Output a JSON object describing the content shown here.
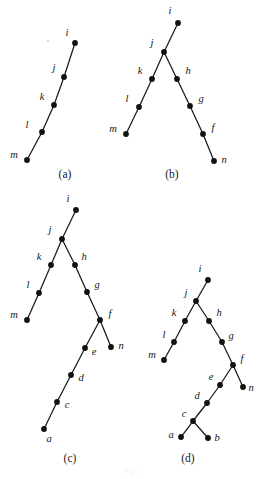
{
  "figure": {
    "background_color": "#ffffff",
    "ink_color": "#111111",
    "bottom_caption": "Fig. 1. ",
    "panels": [
      {
        "id": "a",
        "caption": "(a)",
        "caption_pos": {
          "x": 65,
          "y": 178
        },
        "nodes": [
          {
            "name": "i",
            "x": 75,
            "y": 43,
            "label": "i",
            "label_x": 67,
            "label_y": 36,
            "anchor": "middle"
          },
          {
            "name": "j",
            "x": 64,
            "y": 77,
            "label": "j",
            "label_x": 54,
            "label_y": 71,
            "anchor": "middle"
          },
          {
            "name": "k",
            "x": 54,
            "y": 105,
            "label": "k",
            "label_x": 42,
            "label_y": 100,
            "anchor": "middle"
          },
          {
            "name": "l",
            "x": 42,
            "y": 132,
            "label": "l",
            "label_x": 27,
            "label_y": 128,
            "anchor": "middle"
          },
          {
            "name": "m",
            "x": 27,
            "y": 160,
            "label": "m",
            "label_x": 14,
            "label_y": 158,
            "anchor": "middle"
          }
        ],
        "edges": [
          [
            "i",
            "j"
          ],
          [
            "j",
            "k"
          ],
          [
            "k",
            "l"
          ],
          [
            "l",
            "m"
          ]
        ]
      },
      {
        "id": "b",
        "caption": "(b)",
        "caption_pos": {
          "x": 172,
          "y": 178
        },
        "nodes": [
          {
            "name": "i",
            "x": 178,
            "y": 23,
            "label": "i",
            "label_x": 170,
            "label_y": 14,
            "anchor": "middle"
          },
          {
            "name": "j",
            "x": 164,
            "y": 52,
            "label": "j",
            "label_x": 152,
            "label_y": 46,
            "anchor": "middle"
          },
          {
            "name": "k",
            "x": 152,
            "y": 79,
            "label": "k",
            "label_x": 140,
            "label_y": 74,
            "anchor": "middle"
          },
          {
            "name": "l",
            "x": 139,
            "y": 107,
            "label": "l",
            "label_x": 127,
            "label_y": 102,
            "anchor": "middle"
          },
          {
            "name": "m",
            "x": 126,
            "y": 134,
            "label": "m",
            "label_x": 113,
            "label_y": 132,
            "anchor": "middle"
          },
          {
            "name": "h",
            "x": 177,
            "y": 79,
            "label": "h",
            "label_x": 188,
            "label_y": 74,
            "anchor": "middle"
          },
          {
            "name": "g",
            "x": 190,
            "y": 106,
            "label": "g",
            "label_x": 201,
            "label_y": 102,
            "anchor": "middle"
          },
          {
            "name": "f",
            "x": 203,
            "y": 134,
            "label": "f",
            "label_x": 213,
            "label_y": 131,
            "anchor": "middle"
          },
          {
            "name": "n",
            "x": 214,
            "y": 161,
            "label": "n",
            "label_x": 224,
            "label_y": 163,
            "anchor": "middle"
          }
        ],
        "edges": [
          [
            "i",
            "j"
          ],
          [
            "j",
            "k"
          ],
          [
            "k",
            "l"
          ],
          [
            "l",
            "m"
          ],
          [
            "j",
            "h"
          ],
          [
            "h",
            "g"
          ],
          [
            "g",
            "f"
          ],
          [
            "f",
            "n"
          ]
        ]
      },
      {
        "id": "c",
        "caption": "(c)",
        "caption_pos": {
          "x": 70,
          "y": 462
        },
        "nodes": [
          {
            "name": "i",
            "x": 76,
            "y": 210,
            "label": "i",
            "label_x": 68,
            "label_y": 202,
            "anchor": "middle"
          },
          {
            "name": "j",
            "x": 62,
            "y": 239,
            "label": "j",
            "label_x": 50,
            "label_y": 233,
            "anchor": "middle"
          },
          {
            "name": "k",
            "x": 51,
            "y": 265,
            "label": "k",
            "label_x": 39,
            "label_y": 260,
            "anchor": "middle"
          },
          {
            "name": "l",
            "x": 39,
            "y": 293,
            "label": "l",
            "label_x": 28,
            "label_y": 288,
            "anchor": "middle"
          },
          {
            "name": "m",
            "x": 27,
            "y": 320,
            "label": "m",
            "label_x": 14,
            "label_y": 318,
            "anchor": "middle"
          },
          {
            "name": "h",
            "x": 75,
            "y": 265,
            "label": "h",
            "label_x": 84,
            "label_y": 260,
            "anchor": "middle"
          },
          {
            "name": "g",
            "x": 87,
            "y": 292,
            "label": "g",
            "label_x": 97,
            "label_y": 288,
            "anchor": "middle"
          },
          {
            "name": "f",
            "x": 100,
            "y": 320,
            "label": "f",
            "label_x": 110,
            "label_y": 317,
            "anchor": "middle"
          },
          {
            "name": "n",
            "x": 111,
            "y": 347,
            "label": "n",
            "label_x": 121,
            "label_y": 349,
            "anchor": "middle"
          },
          {
            "name": "e",
            "x": 85,
            "y": 348,
            "label": "e",
            "label_x": 94,
            "label_y": 355,
            "anchor": "middle"
          },
          {
            "name": "d",
            "x": 71,
            "y": 375,
            "label": "d",
            "label_x": 81,
            "label_y": 381,
            "anchor": "middle"
          },
          {
            "name": "c",
            "x": 57,
            "y": 402,
            "label": "c",
            "label_x": 67,
            "label_y": 408,
            "anchor": "middle"
          },
          {
            "name": "a",
            "x": 44,
            "y": 429,
            "label": "a",
            "label_x": 49,
            "label_y": 442,
            "anchor": "middle"
          }
        ],
        "edges": [
          [
            "i",
            "j"
          ],
          [
            "j",
            "k"
          ],
          [
            "k",
            "l"
          ],
          [
            "l",
            "m"
          ],
          [
            "j",
            "h"
          ],
          [
            "h",
            "g"
          ],
          [
            "g",
            "f"
          ],
          [
            "f",
            "n"
          ],
          [
            "f",
            "e"
          ],
          [
            "e",
            "d"
          ],
          [
            "d",
            "c"
          ],
          [
            "c",
            "a"
          ]
        ]
      },
      {
        "id": "d",
        "caption": "(d)",
        "caption_pos": {
          "x": 188,
          "y": 462
        },
        "nodes": [
          {
            "name": "i",
            "x": 208,
            "y": 280,
            "label": "i",
            "label_x": 200,
            "label_y": 272,
            "anchor": "middle"
          },
          {
            "name": "j",
            "x": 196,
            "y": 301,
            "label": "j",
            "label_x": 186,
            "label_y": 296,
            "anchor": "middle"
          },
          {
            "name": "k",
            "x": 185,
            "y": 321,
            "label": "k",
            "label_x": 174,
            "label_y": 316,
            "anchor": "middle"
          },
          {
            "name": "l",
            "x": 174,
            "y": 342,
            "label": "l",
            "label_x": 164,
            "label_y": 338,
            "anchor": "middle"
          },
          {
            "name": "m",
            "x": 164,
            "y": 360,
            "label": "m",
            "label_x": 152,
            "label_y": 358,
            "anchor": "middle"
          },
          {
            "name": "h",
            "x": 209,
            "y": 321,
            "label": "h",
            "label_x": 219,
            "label_y": 316,
            "anchor": "middle"
          },
          {
            "name": "g",
            "x": 222,
            "y": 342,
            "label": "g",
            "label_x": 231,
            "label_y": 339,
            "anchor": "middle"
          },
          {
            "name": "f",
            "x": 233,
            "y": 365,
            "label": "f",
            "label_x": 242,
            "label_y": 362,
            "anchor": "middle"
          },
          {
            "name": "n",
            "x": 243,
            "y": 387,
            "label": "n",
            "label_x": 251,
            "label_y": 391,
            "anchor": "middle"
          },
          {
            "name": "e",
            "x": 220,
            "y": 385,
            "label": "e",
            "label_x": 211,
            "label_y": 380,
            "anchor": "middle"
          },
          {
            "name": "d",
            "x": 207,
            "y": 403,
            "label": "d",
            "label_x": 197,
            "label_y": 399,
            "anchor": "middle"
          },
          {
            "name": "c",
            "x": 193,
            "y": 421,
            "label": "c",
            "label_x": 184,
            "label_y": 417,
            "anchor": "middle"
          },
          {
            "name": "a",
            "x": 181,
            "y": 437,
            "label": "a",
            "label_x": 171,
            "label_y": 438,
            "anchor": "middle"
          },
          {
            "name": "b",
            "x": 208,
            "y": 438,
            "label": "b",
            "label_x": 217,
            "label_y": 441,
            "anchor": "middle"
          }
        ],
        "edges": [
          [
            "i",
            "j"
          ],
          [
            "j",
            "k"
          ],
          [
            "k",
            "l"
          ],
          [
            "l",
            "m"
          ],
          [
            "j",
            "h"
          ],
          [
            "h",
            "g"
          ],
          [
            "g",
            "f"
          ],
          [
            "f",
            "n"
          ],
          [
            "f",
            "e"
          ],
          [
            "e",
            "d"
          ],
          [
            "d",
            "c"
          ],
          [
            "c",
            "a"
          ],
          [
            "c",
            "b"
          ]
        ]
      }
    ],
    "specks": [
      {
        "x": 48,
        "y": 41,
        "r": 1.0
      }
    ]
  }
}
